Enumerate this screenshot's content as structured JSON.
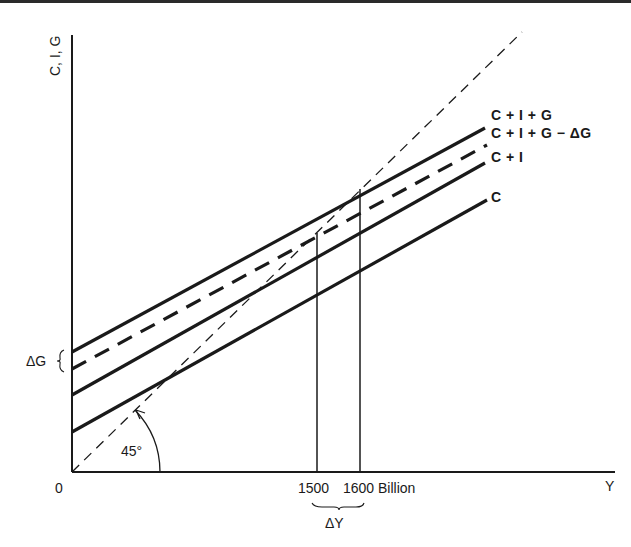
{
  "diagram": {
    "y_axis_label": "C, I, G",
    "x_axis_label": "Y",
    "origin_label": "0",
    "angle_label": "45°",
    "delta_g_label": "ΔG",
    "delta_y_label": "ΔY",
    "x_ticks": [
      {
        "label": "1500"
      },
      {
        "label": "1600 Billion"
      }
    ],
    "curves": [
      {
        "label": "C + I + G",
        "style": "solid"
      },
      {
        "label": "C + I + G − ΔG",
        "style": "dashed"
      },
      {
        "label": "C + I",
        "style": "solid"
      },
      {
        "label": "C",
        "style": "solid"
      }
    ],
    "reference_line": {
      "label": "45° line",
      "style": "dashed"
    },
    "colors": {
      "ink": "#1a1a1a",
      "background": "#ffffff"
    }
  }
}
